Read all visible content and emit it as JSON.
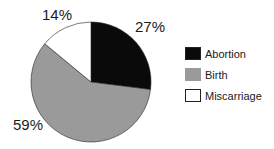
{
  "chart_data": {
    "type": "pie",
    "title": "",
    "start_angle": "12 o'clock, clockwise",
    "slices": [
      {
        "label": "Abortion",
        "value": 27,
        "display": "27%",
        "color": "#0a0a0a"
      },
      {
        "label": "Birth",
        "value": 59,
        "display": "59%",
        "color": "#9a9a9a"
      },
      {
        "label": "Miscarriage",
        "value": 14,
        "display": "14%",
        "color": "#ffffff"
      }
    ],
    "legend": {
      "position": "right",
      "entries": [
        "Abortion",
        "Birth",
        "Miscarriage"
      ]
    }
  }
}
